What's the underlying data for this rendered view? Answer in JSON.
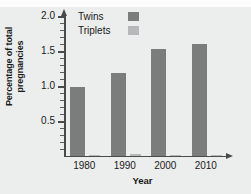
{
  "chart_data": {
    "type": "bar",
    "title": "",
    "xlabel": "Year",
    "ylabel_line1": "Percentage of total",
    "ylabel_line2": "pregnancies",
    "ylabel": "Percentage of total pregnancies",
    "categories": [
      "1980",
      "1990",
      "2000",
      "2010"
    ],
    "series": [
      {
        "name": "Twins",
        "color": "#7b7c7c",
        "values": [
          0.99,
          1.18,
          1.53,
          1.6
        ]
      },
      {
        "name": "Triplets",
        "color": "#b5b9b9",
        "values": [
          0.0,
          0.03,
          0.02,
          0.02
        ]
      }
    ],
    "ylim": [
      0,
      2.0
    ],
    "ytick_labels": [
      "0.5",
      "1.0",
      "1.5",
      "2.0"
    ],
    "ytick_values": [
      0.5,
      1.0,
      1.5,
      2.0
    ],
    "yminor_step": 0.1,
    "grid": false,
    "legend_position": "top-left-inside"
  },
  "legend": {
    "entries": [
      {
        "label": "Twins"
      },
      {
        "label": "Triplets"
      }
    ]
  },
  "axes": {
    "x_title": "Year",
    "y_title_line1": "Percentage of total",
    "y_title_line2": "pregnancies",
    "x_labels": [
      "1980",
      "1990",
      "2000",
      "2010"
    ],
    "y_labels": [
      "2.0",
      "1.5",
      "1.0",
      "0.5"
    ]
  },
  "colors": {
    "background": "#eceded",
    "top_band": "#fcfcfc",
    "axis": "#4a4a4a",
    "text": "#1a1a1a",
    "twins": "#7b7c7c",
    "triplets": "#b5b9b9"
  }
}
